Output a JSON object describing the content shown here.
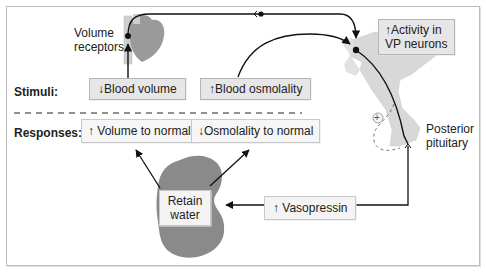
{
  "diagram": {
    "row_labels": {
      "stimuli": "Stimuli:",
      "responses": "Responses:"
    },
    "structures": {
      "volume_receptors": [
        "Volume",
        "receptors"
      ],
      "posterior_pituitary": [
        "Posterior",
        "pituitary"
      ],
      "hypothalamus_sign": "+"
    },
    "stimuli": {
      "blood_volume": "↓Blood volume",
      "blood_osmolality": "↑Blood osmolality"
    },
    "responses": {
      "volume": "↑ Volume to normal",
      "osmolality": "↓Osmolality to normal"
    },
    "neurons": [
      "↑Activity in",
      "VP neurons"
    ],
    "hormone": "↑ Vasopressin",
    "kidney_action": [
      "Retain",
      "water"
    ],
    "colors": {
      "line": "#111111",
      "organ_gray": "#8a8a8a",
      "heart_gray": "#9a9a9a",
      "brain_gray": "#d4d4d4",
      "box_fill": "#f2f2f2",
      "frame": "#bdbdbd"
    }
  }
}
